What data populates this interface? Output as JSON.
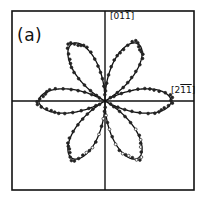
{
  "figure": {
    "panel_label": "(a)",
    "y_axis_label": {
      "open": "[01",
      "bar": "1",
      "close": "]"
    },
    "x_axis_label": {
      "open": "[2",
      "bar1": "1",
      "bar2": "1",
      "close": "]"
    },
    "colors": {
      "line": "#111111",
      "markers": "#222222",
      "background": "#ffffff"
    }
  },
  "chart_data": {
    "type": "polar",
    "title": "(a)",
    "axes": {
      "horizontal_direction": "[2-1-1]",
      "vertical_direction": "[01-1]"
    },
    "petal_angles_deg": [
      0,
      60,
      120,
      180,
      240,
      300
    ],
    "petal_count": 6,
    "r_max_normalized": 1.0,
    "fit_function": "r = |cos(3θ)|",
    "series": [
      {
        "name": "measured",
        "style": "markers"
      },
      {
        "name": "fit",
        "style": "solid line"
      }
    ],
    "grid": false,
    "legend": null
  }
}
